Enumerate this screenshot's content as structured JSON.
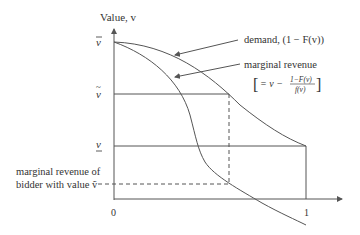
{
  "diagram": {
    "type": "economics-curve-diagram",
    "y_axis_label": "Value, v",
    "x_ticks": [
      "0",
      "1"
    ],
    "y_ticks": {
      "v_bar": "v̄",
      "v_tilde": "ṽ",
      "v_under": "v"
    },
    "curves": [
      {
        "name": "demand",
        "label": "demand, (1 − F(v))"
      },
      {
        "name": "marginal-revenue",
        "label": "marginal revenue",
        "formula_prefix": "= v −",
        "formula_num": "1−F(v)",
        "formula_den": "f(v)"
      }
    ],
    "annotation": {
      "line1": "marginal revenue of",
      "line2": "bidder with value ṽ"
    },
    "colors": {
      "line": "#555555",
      "text": "#333333",
      "background": "#ffffff"
    }
  }
}
